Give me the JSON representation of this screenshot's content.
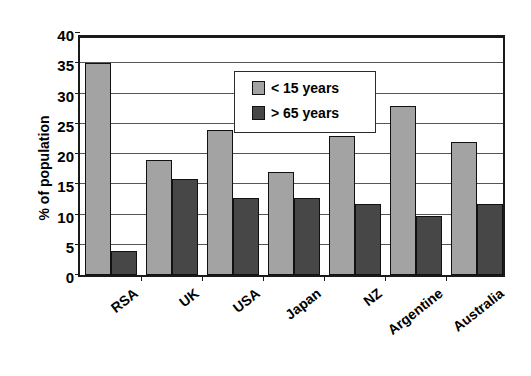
{
  "chart_data": {
    "type": "bar",
    "title": "",
    "xlabel": "",
    "ylabel": "% of population",
    "ylim": [
      0,
      40
    ],
    "ytick_step": 5,
    "yticks": [
      0,
      5,
      10,
      15,
      20,
      25,
      30,
      35,
      40
    ],
    "grid": true,
    "legend_position": "upper-center",
    "categories": [
      "RSA",
      "UK",
      "USA",
      "Japan",
      "NZ",
      "Argentine",
      "Australia"
    ],
    "series": [
      {
        "name": "< 15 years",
        "color": "#a3a3a3",
        "values": [
          35,
          19,
          24,
          17,
          23,
          28,
          22
        ]
      },
      {
        "name": "> 65 years",
        "color": "#474747",
        "values": [
          4,
          15.8,
          12.8,
          12.8,
          11.8,
          9.8,
          11.7
        ]
      }
    ]
  },
  "axis": {
    "frame_color": "#1a1a1a",
    "gridline_color": "#555555"
  }
}
